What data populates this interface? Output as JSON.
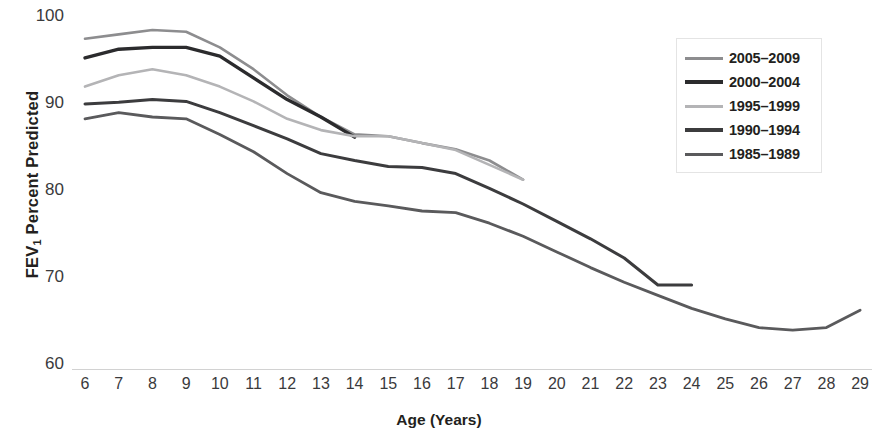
{
  "chart_data": {
    "type": "line",
    "title": "",
    "xlabel": "Age (Years)",
    "ylabel": "FEV1 Percent Predicted",
    "ylabel_parts": {
      "prefix": "FEV",
      "subscript": "1",
      "suffix": " Percent Predicted"
    },
    "xlim": [
      6,
      29
    ],
    "ylim": [
      60,
      100
    ],
    "grid": false,
    "legend_position": "top-right",
    "x_tick_labels": [
      "6",
      "7",
      "8",
      "9",
      "10",
      "11",
      "12",
      "13",
      "14",
      "15",
      "16",
      "17",
      "18",
      "19",
      "20",
      "21",
      "22",
      "23",
      "24",
      "25",
      "26",
      "27",
      "28",
      "29"
    ],
    "y_tick_labels": [
      "100",
      "90",
      "80",
      "70",
      "60"
    ],
    "y_tick_values": [
      100,
      90,
      80,
      70,
      60
    ],
    "x": [
      6,
      7,
      8,
      9,
      10,
      11,
      12,
      13,
      14,
      15,
      16,
      17,
      18,
      19,
      20,
      21,
      22,
      23,
      24,
      25,
      26,
      27,
      28,
      29
    ],
    "series": [
      {
        "name": "2005–2009",
        "color": "#8d8d8f",
        "width": 2.6,
        "x": [
          6,
          7,
          8,
          9,
          10,
          11,
          12,
          13,
          14,
          15,
          16,
          17,
          18,
          19
        ],
        "values": [
          97.5,
          98.0,
          98.5,
          98.3,
          96.5,
          94.0,
          91.0,
          88.5,
          86.5,
          86.3,
          85.5,
          84.8,
          83.5,
          81.3
        ]
      },
      {
        "name": "2000–2004",
        "color": "#2b2b2d",
        "width": 3.4,
        "x": [
          6,
          7,
          8,
          9,
          10,
          11,
          12,
          13,
          14
        ],
        "values": [
          95.3,
          96.3,
          96.5,
          96.5,
          95.5,
          93.0,
          90.5,
          88.5,
          86.2
        ]
      },
      {
        "name": "1995–1999",
        "color": "#b4b4b6",
        "width": 2.6,
        "x": [
          6,
          7,
          8,
          9,
          10,
          11,
          12,
          13,
          14,
          15,
          16,
          17,
          18,
          19
        ],
        "values": [
          92.0,
          93.3,
          94.0,
          93.3,
          92.0,
          90.3,
          88.3,
          87.0,
          86.3,
          86.3,
          85.5,
          84.7,
          83.0,
          81.3
        ]
      },
      {
        "name": "1990–1994",
        "color": "#3c3c3e",
        "width": 3.0,
        "x": [
          6,
          7,
          8,
          9,
          10,
          11,
          12,
          13,
          14,
          15,
          16,
          17,
          18,
          19,
          20,
          21,
          22,
          23,
          24
        ],
        "values": [
          90.0,
          90.2,
          90.5,
          90.3,
          89.0,
          87.5,
          86.0,
          84.3,
          83.5,
          82.8,
          82.7,
          82.0,
          80.3,
          78.5,
          76.5,
          74.5,
          72.3,
          69.2,
          69.2
        ]
      },
      {
        "name": "1985–1989",
        "color": "#5a5a5c",
        "width": 2.8,
        "x": [
          6,
          7,
          8,
          9,
          10,
          11,
          12,
          13,
          14,
          15,
          16,
          17,
          18,
          19,
          20,
          21,
          22,
          23,
          24,
          25,
          26,
          27,
          28,
          29
        ],
        "values": [
          88.3,
          89.0,
          88.5,
          88.3,
          86.5,
          84.5,
          82.0,
          79.8,
          78.8,
          78.3,
          77.7,
          77.5,
          76.3,
          74.8,
          73.0,
          71.2,
          69.5,
          68.0,
          66.5,
          65.3,
          64.3,
          64.0,
          64.3,
          66.3
        ]
      }
    ]
  },
  "legend": {
    "items": [
      {
        "label": "2005–2009"
      },
      {
        "label": "2000–2004"
      },
      {
        "label": "1995–1999"
      },
      {
        "label": "1990–1994"
      },
      {
        "label": "1985–1989"
      }
    ]
  },
  "axes": {
    "x_title": "Age (Years)",
    "y_title_prefix": "FEV",
    "y_title_sub": "1",
    "y_title_suffix": " Percent Predicted"
  }
}
